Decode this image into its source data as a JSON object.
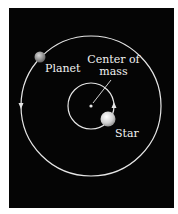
{
  "diagram": {
    "type": "orbit-diagram",
    "background": "#050505",
    "line_color": "#e6e6e6",
    "labels": {
      "planet": "Planet",
      "center_line1": "Center of",
      "center_line2": "mass",
      "star": "Star"
    },
    "bodies": [
      {
        "name": "Planet",
        "color": "#9a9a9a"
      },
      {
        "name": "Star",
        "color": "#cfcfcf"
      }
    ],
    "orbits": [
      {
        "name": "planet-orbit",
        "direction": "counterclockwise"
      },
      {
        "name": "star-orbit",
        "direction": "counterclockwise"
      }
    ]
  }
}
